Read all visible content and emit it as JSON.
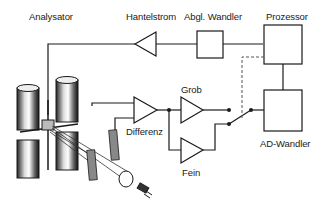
{
  "diagram": {
    "labels": {
      "analysator": "Analysator",
      "hantelstrom": "Hantelstrom",
      "abgl_wandler": "Abgl. Wandler",
      "prozessor": "Prozessor",
      "grob": "Grob",
      "differenz": "Differenz",
      "ad_wandler": "AD-Wandler",
      "fein": "Fein"
    },
    "colors": {
      "line": "#1a1a1a",
      "dashed": "#555555",
      "background": "#ffffff"
    }
  }
}
